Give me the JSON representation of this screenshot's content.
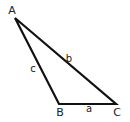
{
  "diagram": {
    "type": "triangle",
    "stroke_color": "#111111",
    "vertices": [
      {
        "id": "A",
        "label": "A",
        "x": 15,
        "y": 18,
        "lx": 12,
        "ly": 14
      },
      {
        "id": "B",
        "label": "B",
        "x": 59,
        "y": 104,
        "lx": 60,
        "ly": 116
      },
      {
        "id": "C",
        "label": "C",
        "x": 116,
        "y": 104,
        "lx": 117,
        "ly": 116
      }
    ],
    "sides": [
      {
        "id": "a",
        "label": "a",
        "from": "B",
        "to": "C",
        "lx": 89,
        "ly": 112
      },
      {
        "id": "b",
        "label": "b",
        "from": "A",
        "to": "C",
        "lx": 69,
        "ly": 62
      },
      {
        "id": "c",
        "label": "c",
        "from": "A",
        "to": "B",
        "lx": 33,
        "ly": 72
      }
    ]
  }
}
